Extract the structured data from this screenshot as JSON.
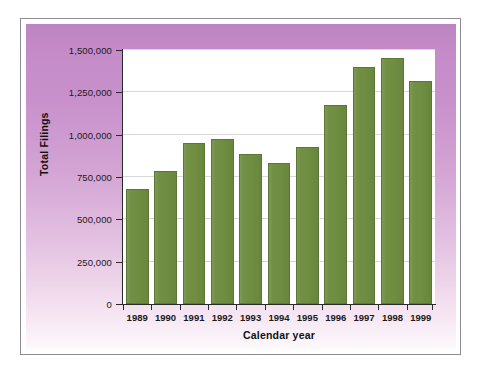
{
  "chart_data": {
    "type": "bar",
    "title": "",
    "xlabel": "Calendar year",
    "ylabel": "Total Filings",
    "categories": [
      "1989",
      "1990",
      "1991",
      "1992",
      "1993",
      "1994",
      "1995",
      "1996",
      "1997",
      "1998",
      "1999"
    ],
    "values": [
      680000,
      785000,
      950000,
      975000,
      885000,
      830000,
      925000,
      1175000,
      1400000,
      1450000,
      1315000
    ],
    "series": [
      {
        "name": "Total Filings",
        "values": [
          680000,
          785000,
          950000,
          975000,
          885000,
          830000,
          925000,
          1175000,
          1400000,
          1450000,
          1315000
        ]
      }
    ],
    "ylim": [
      0,
      1500000
    ],
    "y_ticks": [
      0,
      250000,
      500000,
      750000,
      1000000,
      1250000,
      1500000
    ],
    "y_tick_labels": [
      "0",
      "250,000",
      "500,000",
      "750,000",
      "1,000,000",
      "1,250,000",
      "1,500,000"
    ],
    "grid": "horizontal",
    "legend": "none",
    "bar_color": "#6f8e41",
    "bar_edge_color": "#5b7635",
    "plot_background": "#ffffff",
    "panel_gradient_top": "#bd84c2",
    "panel_gradient_bottom": "#fdfafd",
    "frame_border_color": "#8c8c96",
    "gridline_color": "#d8d8d8",
    "axis_color": "#2a2a2a"
  }
}
